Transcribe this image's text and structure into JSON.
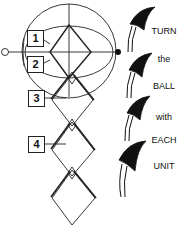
{
  "diagram": {
    "step_labels": [
      "1",
      "2",
      "3",
      "4"
    ],
    "instruction_words": [
      "TURN",
      "the",
      "BALL",
      "with",
      "EACH",
      "UNIT"
    ],
    "colors": {
      "line": "#222222",
      "fill": "#111111",
      "background": "#ffffff"
    }
  }
}
